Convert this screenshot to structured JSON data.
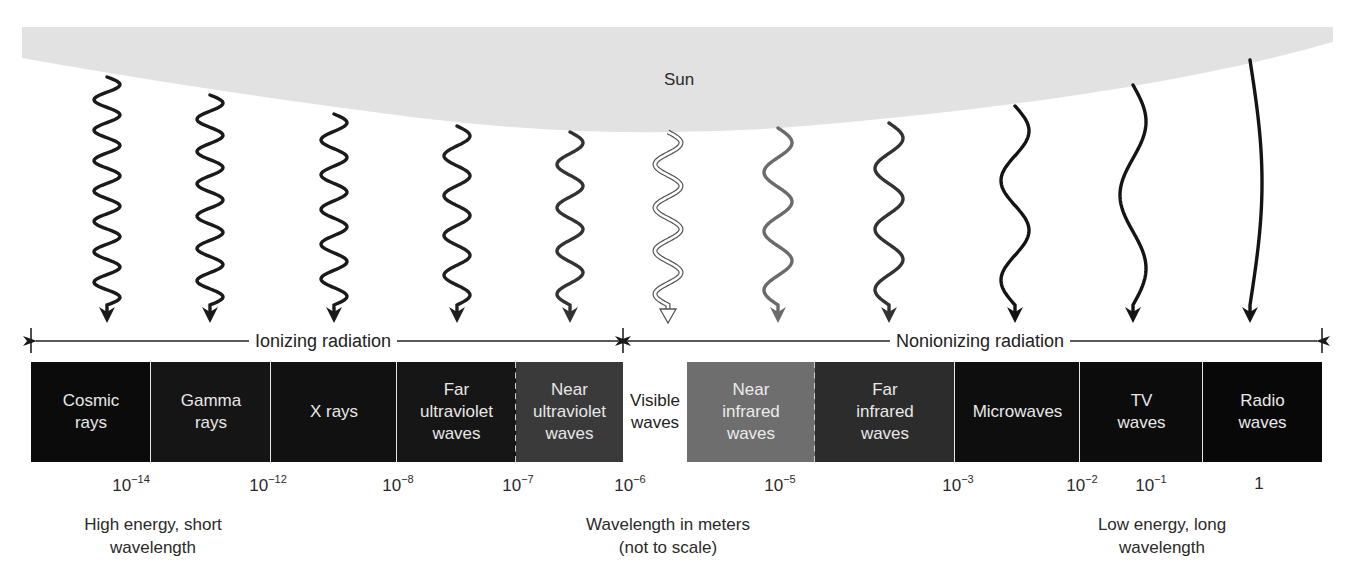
{
  "source": {
    "label": "Sun",
    "fill": "#e2e2e2"
  },
  "groups": [
    {
      "label": "Ionizing radiation",
      "from_x": 31,
      "to_x": 623
    },
    {
      "label": "Nonionizing radiation",
      "from_x": 623,
      "to_x": 1322
    }
  ],
  "bands": [
    {
      "lines": [
        "Cosmic",
        "rays"
      ],
      "x0": 31,
      "x1": 151,
      "fill": "#0b0b0b",
      "text_color": "#e8e8e8",
      "divider_after": "solid"
    },
    {
      "lines": [
        "Gamma",
        "rays"
      ],
      "x0": 151,
      "x1": 271,
      "fill": "#151515",
      "text_color": "#e8e8e8",
      "divider_after": "solid"
    },
    {
      "lines": [
        "X rays"
      ],
      "x0": 271,
      "x1": 397,
      "fill": "#111111",
      "text_color": "#e8e8e8",
      "divider_after": "solid"
    },
    {
      "lines": [
        "Far",
        "ultraviolet",
        "waves"
      ],
      "x0": 397,
      "x1": 516,
      "fill": "#161616",
      "text_color": "#e8e8e8",
      "divider_after": "dashed"
    },
    {
      "lines": [
        "Near",
        "ultraviolet",
        "waves"
      ],
      "x0": 516,
      "x1": 623,
      "fill": "#3a3a3a",
      "text_color": "#e8e8e8",
      "divider_after": "none"
    },
    {
      "lines": [
        "Visible",
        "waves"
      ],
      "x0": 623,
      "x1": 687,
      "fill": "#ffffff",
      "text_color": "#222222",
      "divider_after": "none"
    },
    {
      "lines": [
        "Near",
        "infrared",
        "waves"
      ],
      "x0": 687,
      "x1": 815,
      "fill": "#6e6e6e",
      "text_color": "#ececec",
      "divider_after": "dashed"
    },
    {
      "lines": [
        "Far",
        "infrared",
        "waves"
      ],
      "x0": 815,
      "x1": 955,
      "fill": "#2c2c2c",
      "text_color": "#e8e8e8",
      "divider_after": "solid"
    },
    {
      "lines": [
        "Microwaves"
      ],
      "x0": 955,
      "x1": 1080,
      "fill": "#0e0e0e",
      "text_color": "#e8e8e8",
      "divider_after": "solid"
    },
    {
      "lines": [
        "TV",
        "waves"
      ],
      "x0": 1080,
      "x1": 1203,
      "fill": "#0c0c0c",
      "text_color": "#e8e8e8",
      "divider_after": "solid"
    },
    {
      "lines": [
        "Radio",
        "waves"
      ],
      "x0": 1203,
      "x1": 1322,
      "fill": "#080808",
      "text_color": "#e8e8e8",
      "divider_after": "none"
    }
  ],
  "waves": [
    {
      "name": "cosmic",
      "x": 107,
      "y_start": 77,
      "cycles": 7.5,
      "amp": 13,
      "color": "#1a1a1a",
      "style": "solid"
    },
    {
      "name": "gamma",
      "x": 210,
      "y_start": 95,
      "cycles": 6.5,
      "amp": 13,
      "color": "#1a1a1a",
      "style": "solid"
    },
    {
      "name": "xray",
      "x": 334,
      "y_start": 114,
      "cycles": 5.5,
      "amp": 13,
      "color": "#1a1a1a",
      "style": "solid"
    },
    {
      "name": "far-uv",
      "x": 457,
      "y_start": 126,
      "cycles": 4.5,
      "amp": 13,
      "color": "#1f1f1f",
      "style": "solid"
    },
    {
      "name": "near-uv",
      "x": 570,
      "y_start": 132,
      "cycles": 4.0,
      "amp": 13,
      "color": "#333333",
      "style": "solid"
    },
    {
      "name": "visible",
      "x": 668,
      "y_start": 132,
      "cycles": 4.0,
      "amp": 13,
      "color": "#ffffff",
      "style": "outline"
    },
    {
      "name": "near-ir",
      "x": 778,
      "y_start": 128,
      "cycles": 3.0,
      "amp": 14,
      "color": "#6b6b6b",
      "style": "solid"
    },
    {
      "name": "far-ir",
      "x": 889,
      "y_start": 123,
      "cycles": 3.0,
      "amp": 14,
      "color": "#333333",
      "style": "solid"
    },
    {
      "name": "micro",
      "x": 1015,
      "y_start": 106,
      "cycles": 2.0,
      "amp": 14,
      "color": "#141414",
      "style": "solid"
    },
    {
      "name": "tv",
      "x": 1133,
      "y_start": 85,
      "cycles": 1.5,
      "amp": 13,
      "color": "#141414",
      "style": "solid"
    },
    {
      "name": "radio",
      "x": 1250,
      "y_start": 60,
      "cycles": 0.5,
      "amp": 12,
      "color": "#141414",
      "style": "solid"
    }
  ],
  "wavelength_ticks": [
    {
      "base": "10",
      "exp": "−14",
      "x": 131
    },
    {
      "base": "10",
      "exp": "−12",
      "x": 268
    },
    {
      "base": "10",
      "exp": "−8",
      "x": 398
    },
    {
      "base": "10",
      "exp": "−7",
      "x": 518
    },
    {
      "base": "10",
      "exp": "−6",
      "x": 630
    },
    {
      "base": "10",
      "exp": "−5",
      "x": 780
    },
    {
      "base": "10",
      "exp": "−3",
      "x": 958
    },
    {
      "base": "10",
      "exp": "−2",
      "x": 1082
    },
    {
      "base": "10",
      "exp": "−1",
      "x": 1151
    },
    {
      "base": "1",
      "exp": "",
      "x": 1259
    }
  ],
  "footer": {
    "left": {
      "lines": [
        "High energy, short",
        "wavelength"
      ],
      "x": 153
    },
    "center": {
      "lines": [
        "Wavelength in meters",
        "(not to scale)"
      ],
      "x": 668
    },
    "right": {
      "lines": [
        "Low energy, long",
        "wavelength"
      ],
      "x": 1162
    }
  }
}
